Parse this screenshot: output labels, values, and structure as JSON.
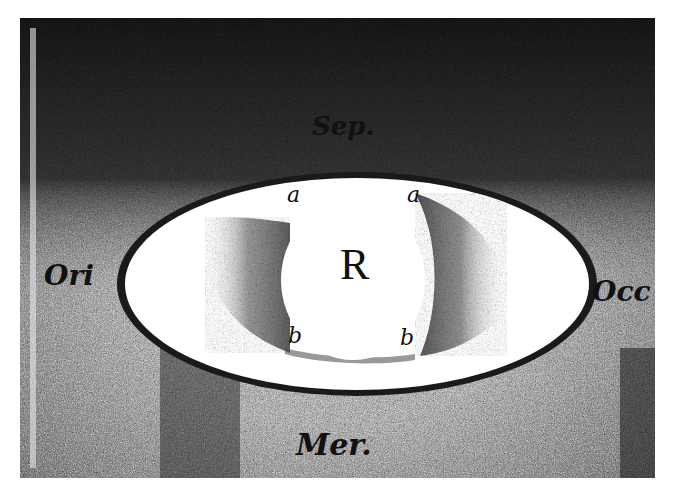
{
  "figure": {
    "labels": {
      "top": "Sep.",
      "left": "Ori",
      "right": "Occ",
      "bottom": "Mer.",
      "center": "R",
      "upper_left_point": "a",
      "upper_right_point": "a",
      "lower_left_point": "b",
      "lower_right_point": "b"
    },
    "colors": {
      "paper": "#ffffff",
      "ink": "#111111",
      "background_dark": "#2a2a2a",
      "background_mid": "#8a8a8a",
      "ring_fill": "#ffffff",
      "ring_border": "#1a1a1a",
      "shadow": "#555555"
    }
  }
}
